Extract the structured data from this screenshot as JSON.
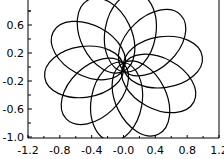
{
  "chart_data": {
    "type": "line",
    "title": "",
    "xlabel": "",
    "ylabel": "",
    "xlim": [
      -1.2,
      1.2
    ],
    "ylim": [
      -1.0,
      0.94
    ],
    "grid": false,
    "legend": null,
    "x_ticks": [
      "-1.2",
      "-0.8",
      "-0.4",
      "-0.0",
      "0.4",
      "0.8",
      "1.2"
    ],
    "y_ticks": [
      "-1.0",
      "-0.6",
      "-0.2",
      "0.2",
      "0.6"
    ],
    "series": [
      {
        "name": "petals",
        "petal_count": 10,
        "semi_major": 0.5,
        "semi_minor": 0.32,
        "start_angle_deg": 80,
        "color": "#000000"
      }
    ]
  }
}
